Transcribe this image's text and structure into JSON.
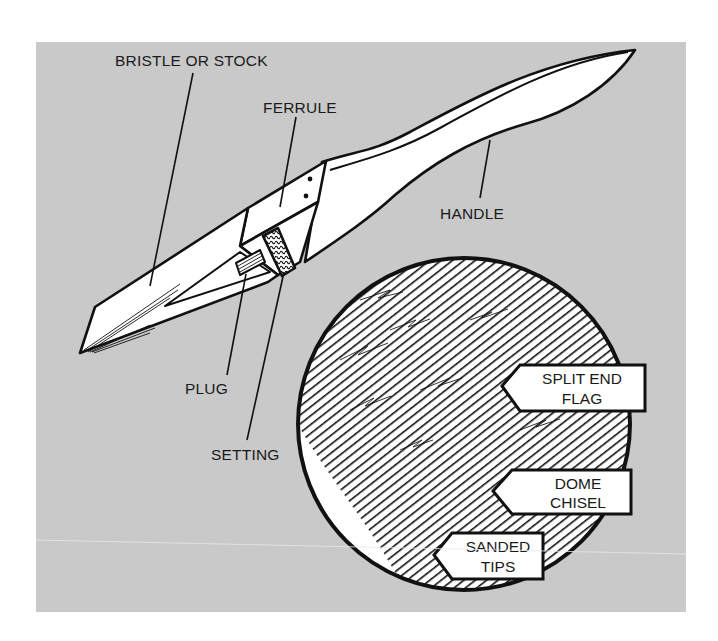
{
  "figure": {
    "background_color": "#c9c9c9",
    "line_color": "#111111",
    "fill_color": "#ffffff"
  },
  "parts": {
    "bristle": "BRISTLE OR STOCK",
    "ferrule": "FERRULE",
    "handle": "HANDLE",
    "plug": "PLUG",
    "setting": "SETTING"
  },
  "detail_callouts": {
    "split_end_flag": [
      "SPLIT END",
      "FLAG"
    ],
    "dome_chisel": [
      "DOME",
      "CHISEL"
    ],
    "sanded_tips": [
      "SANDED",
      "TIPS"
    ]
  }
}
